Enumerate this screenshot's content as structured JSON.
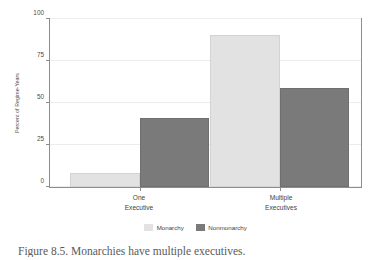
{
  "chart_data": {
    "type": "bar",
    "title": "",
    "xlabel": "",
    "ylabel": "Percent of Regime-Years",
    "categories": [
      "One Executive",
      "Multiple Executives"
    ],
    "category_lines": [
      [
        "One",
        "Executive"
      ],
      [
        "Multiple",
        "Executives"
      ]
    ],
    "series": [
      {
        "name": "Monarchy",
        "values": [
          8.5,
          90.5
        ],
        "color": "#e2e2e2"
      },
      {
        "name": "Nonmonarchy",
        "values": [
          41,
          59
        ],
        "color": "#7a7a7a"
      }
    ],
    "ylim": [
      0,
      100
    ],
    "yticks": [
      0,
      25,
      50,
      75,
      100
    ],
    "ytick_labels": [
      "0",
      "25",
      "50",
      "75",
      "100"
    ],
    "grid": "horizontal",
    "legend_position": "bottom-center",
    "frame": "full-box"
  },
  "axis": {
    "y_title": "Percent of Regime-Years",
    "y_tick_labels": [
      "100",
      "75",
      "50",
      "25",
      "0"
    ]
  },
  "legend": {
    "items": [
      {
        "label": "Monarchy",
        "style": "light"
      },
      {
        "label": "Nonmonarchy",
        "style": "dark"
      }
    ]
  },
  "caption": {
    "text": "Figure 8.5. Monarchies have multiple executives."
  },
  "colors": {
    "monarchy": "#e2e2e2",
    "nonmonarchy": "#7a7a7a",
    "frame": "#8d8d8d",
    "grid": "#ececec",
    "text": "#3f3f3f"
  }
}
